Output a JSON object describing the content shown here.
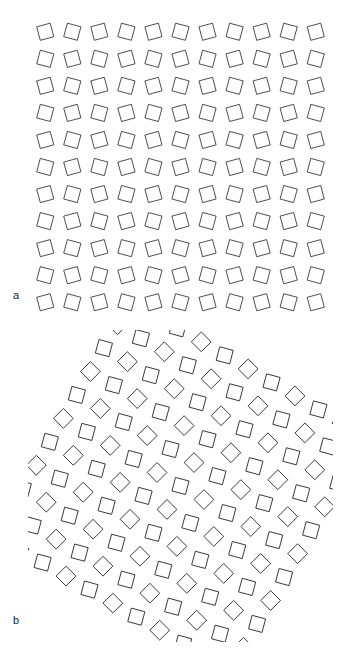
{
  "figure": {
    "panels": [
      {
        "id": "a",
        "label": "a",
        "description": "square-triangle tiling with circular/radial patches"
      },
      {
        "id": "b",
        "label": "b",
        "description": "square-triangle tiling with dodecagonal clusters"
      }
    ],
    "style": {
      "stroke_color": "#222222",
      "background": "#ffffff",
      "edge_length_px": 14
    }
  }
}
